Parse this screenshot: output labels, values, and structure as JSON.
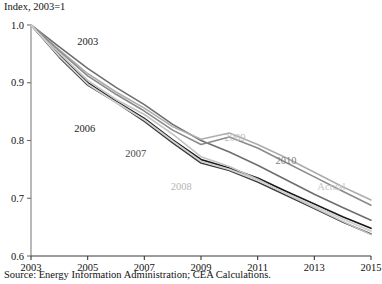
{
  "chart": {
    "axis_title": "Index, 2003=1",
    "source": "Source: Energy Information Administration; CEA Calculations."
  },
  "chart_data": {
    "type": "line",
    "title": "",
    "subtitle": "",
    "xlabel": "",
    "ylabel": "Index, 2003=1",
    "xlim": [
      2003,
      2015
    ],
    "ylim": [
      0.6,
      1.0
    ],
    "yticks": [
      "1.0",
      "0.9",
      "0.8",
      "0.7",
      "0.6"
    ],
    "ytick_values": [
      1.0,
      0.9,
      0.8,
      0.7,
      0.6
    ],
    "xticks": [
      "2003",
      "2005",
      "2007",
      "2009",
      "2011",
      "2013",
      "2015"
    ],
    "xtick_values": [
      2003,
      2005,
      2007,
      2009,
      2011,
      2013,
      2015
    ],
    "grid": false,
    "legend": "inline-labels",
    "annotations": [
      {
        "text": "2003",
        "x": 2005.0,
        "y": 0.965,
        "color": "#1a1a1a"
      },
      {
        "text": "2006",
        "x": 2004.9,
        "y": 0.815,
        "color": "#1a1a1a"
      },
      {
        "text": "2007",
        "x": 2006.7,
        "y": 0.772,
        "color": "#4a4a4a"
      },
      {
        "text": "2008",
        "x": 2008.3,
        "y": 0.714,
        "color": "#b5b5b5"
      },
      {
        "text": "2009",
        "x": 2010.2,
        "y": 0.8,
        "color": "#bdbdbd"
      },
      {
        "text": "2010",
        "x": 2012.0,
        "y": 0.76,
        "color": "#7d7d7d"
      },
      {
        "text": "Actual",
        "x": 2013.6,
        "y": 0.715,
        "color": "#c7c7c7"
      }
    ],
    "x": [
      2003,
      2004,
      2005,
      2006,
      2007,
      2008,
      2009,
      2010,
      2011,
      2012,
      2013,
      2014,
      2015
    ],
    "series": [
      {
        "name": "2003",
        "color": "#6e6e6e",
        "width": 1.6,
        "values": [
          1.0,
          0.962,
          0.925,
          0.892,
          0.862,
          0.828,
          0.8,
          0.78,
          0.757,
          0.732,
          0.707,
          0.684,
          0.662
        ]
      },
      {
        "name": "2006",
        "color": "#1a1a1a",
        "width": 1.8,
        "values": [
          1.0,
          0.948,
          0.9,
          0.868,
          0.838,
          0.801,
          0.767,
          0.752,
          0.735,
          0.712,
          0.69,
          0.668,
          0.648
        ]
      },
      {
        "name": "2007",
        "color": "#3d3d3d",
        "width": 1.6,
        "values": [
          1.0,
          0.944,
          0.896,
          0.866,
          0.833,
          0.796,
          0.761,
          0.748,
          0.728,
          0.705,
          0.682,
          0.659,
          0.638
        ]
      },
      {
        "name": "2008",
        "color": "#c4c4c4",
        "width": 1.6,
        "values": [
          1.0,
          0.951,
          0.904,
          0.871,
          0.845,
          0.811,
          0.772,
          0.755,
          0.733,
          0.708,
          0.684,
          0.66,
          0.637
        ]
      },
      {
        "name": "2009",
        "color": "#adadad",
        "width": 1.6,
        "values": [
          1.0,
          0.957,
          0.916,
          0.884,
          0.856,
          0.824,
          0.802,
          0.813,
          0.793,
          0.77,
          0.745,
          0.72,
          0.697
        ]
      },
      {
        "name": "2010",
        "color": "#8a8a8a",
        "width": 1.6,
        "values": [
          1.0,
          0.955,
          0.912,
          0.88,
          0.851,
          0.818,
          0.793,
          0.806,
          0.787,
          0.762,
          0.737,
          0.712,
          0.688
        ]
      },
      {
        "name": "Actual",
        "color": "#d0d0d0",
        "width": 1.8,
        "values": [
          1.0,
          0.946,
          0.898,
          0.866,
          0.836,
          0.799,
          0.764,
          0.75,
          0.731,
          0.709,
          0.687,
          0.664,
          0.643
        ]
      }
    ]
  }
}
